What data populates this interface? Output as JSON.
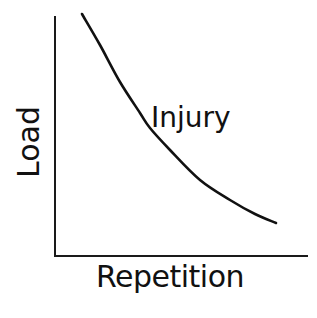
{
  "chart_data": {
    "type": "line",
    "title": "",
    "xlabel": "Repetition",
    "ylabel": "Load",
    "grid": false,
    "legend": null,
    "ticks": {
      "x": [],
      "y": []
    },
    "series": [
      {
        "name": "Injury",
        "description": "Injury threshold curve: load required to cause injury decreases as repetition increases",
        "x": [
          0.11,
          0.18,
          0.26,
          0.34,
          0.38,
          0.46,
          0.58,
          0.7,
          0.79,
          0.88
        ],
        "values": [
          1.0,
          0.87,
          0.72,
          0.59,
          0.53,
          0.44,
          0.32,
          0.23,
          0.18,
          0.14
        ],
        "pixel_points": [
          [
            82,
            14
          ],
          [
            100,
            45
          ],
          [
            120,
            82
          ],
          [
            140,
            113
          ],
          [
            150,
            128
          ],
          [
            170,
            150
          ],
          [
            200,
            180
          ],
          [
            230,
            200
          ],
          [
            255,
            214
          ],
          [
            276,
            223
          ]
        ]
      }
    ],
    "annotations": [
      {
        "text": "Injury",
        "anchor": "curve",
        "position": "right of curve, mid-height"
      }
    ],
    "xlim": [
      0,
      1
    ],
    "ylim": [
      0,
      1
    ]
  },
  "labels": {
    "x_axis": "Repetition",
    "y_axis": "Load",
    "curve": "Injury"
  },
  "colors": {
    "line": "#111111",
    "axis": "#1a1a1a",
    "background": "#ffffff"
  }
}
